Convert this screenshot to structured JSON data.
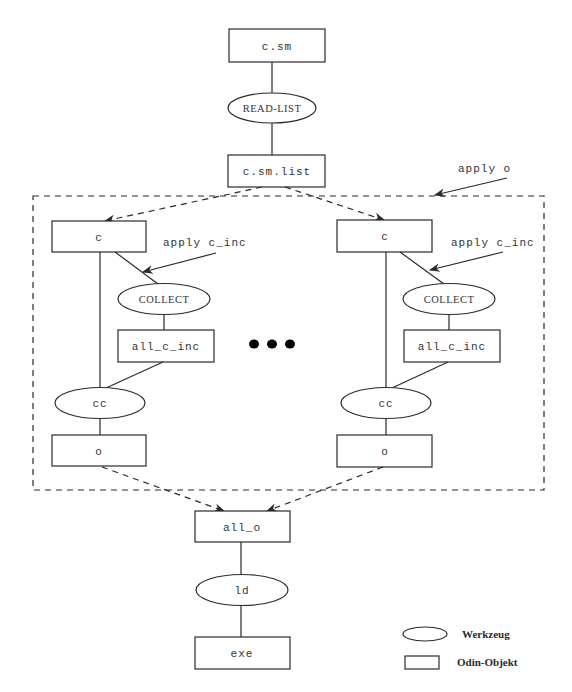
{
  "diagram": {
    "nodes": {
      "c_sm": {
        "label": "c.sm",
        "shape": "Odin-Objekt"
      },
      "read_list": {
        "label": "READ-LIST",
        "shape": "Werkzeug"
      },
      "c_sm_list": {
        "label": "c.sm.list",
        "shape": "Odin-Objekt"
      },
      "left": {
        "c": {
          "label": "c",
          "shape": "Odin-Objekt"
        },
        "collect": {
          "label": "COLLECT",
          "shape": "Werkzeug"
        },
        "all_c_inc": {
          "label": "all_c_inc",
          "shape": "Odin-Objekt"
        },
        "cc": {
          "label": "cc",
          "shape": "Werkzeug"
        },
        "o": {
          "label": "o",
          "shape": "Odin-Objekt"
        }
      },
      "right": {
        "c": {
          "label": "c",
          "shape": "Odin-Objekt"
        },
        "collect": {
          "label": "COLLECT",
          "shape": "Werkzeug"
        },
        "all_c_inc": {
          "label": "all_c_inc",
          "shape": "Odin-Objekt"
        },
        "cc": {
          "label": "cc",
          "shape": "Werkzeug"
        },
        "o": {
          "label": "o",
          "shape": "Odin-Objekt"
        }
      },
      "all_o": {
        "label": "all_o",
        "shape": "Odin-Objekt"
      },
      "ld": {
        "label": "ld",
        "shape": "Werkzeug"
      },
      "exe": {
        "label": "exe",
        "shape": "Odin-Objekt"
      }
    },
    "annotations": {
      "apply_o": "apply o",
      "apply_c_inc_left": "apply c_inc",
      "apply_c_inc_right": "apply c_inc",
      "ellipsis": "..."
    },
    "edges": [
      [
        "c.sm",
        "READ-LIST"
      ],
      [
        "READ-LIST",
        "c.sm.list"
      ],
      [
        "c.sm.list",
        "c (left)",
        "dashed-arrow"
      ],
      [
        "c.sm.list",
        "c (right)",
        "dashed-arrow"
      ],
      [
        "c",
        "COLLECT"
      ],
      [
        "COLLECT",
        "all_c_inc"
      ],
      [
        "c",
        "cc"
      ],
      [
        "all_c_inc",
        "cc"
      ],
      [
        "cc",
        "o"
      ],
      [
        "o (left)",
        "all_o",
        "dashed-arrow"
      ],
      [
        "o (right)",
        "all_o",
        "dashed-arrow"
      ],
      [
        "all_o",
        "ld"
      ],
      [
        "ld",
        "exe"
      ]
    ]
  },
  "legend": {
    "items": [
      {
        "shape": "ellipse",
        "label": "Werkzeug"
      },
      {
        "shape": "rectangle",
        "label": "Odin-Objekt"
      }
    ]
  }
}
